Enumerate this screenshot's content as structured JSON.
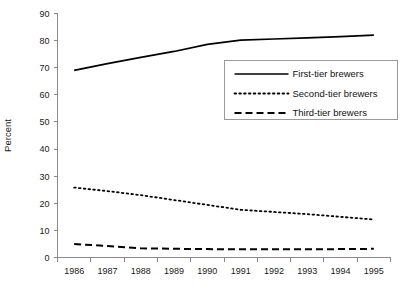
{
  "chart_data": {
    "type": "line",
    "title": "",
    "xlabel": "",
    "ylabel": "Percent",
    "x": [
      1986,
      1987,
      1988,
      1989,
      1990,
      1991,
      1992,
      1993,
      1994,
      1995
    ],
    "categories": [
      "1986",
      "1987",
      "1988",
      "1989",
      "1990",
      "1991",
      "1992",
      "1993",
      "1994",
      "1995"
    ],
    "xlim": [
      1986,
      1995
    ],
    "ylim": [
      0,
      90
    ],
    "ytick_values": [
      0,
      10,
      20,
      30,
      40,
      50,
      60,
      70,
      80,
      90
    ],
    "ytick_labels": [
      "0",
      "10",
      "20",
      "30",
      "40",
      "50",
      "60",
      "70",
      "80",
      "90"
    ],
    "grid": false,
    "legend_position": "upper-right-inside",
    "series": [
      {
        "name": "First-tier brewers",
        "style": "solid",
        "color": "#000000",
        "values": [
          69.0,
          71.5,
          73.8,
          76.0,
          78.6,
          80.2,
          80.6,
          81.0,
          81.5,
          82.0
        ]
      },
      {
        "name": "Second-tier brewers",
        "style": "dotted",
        "color": "#000000",
        "values": [
          25.8,
          24.5,
          23.0,
          21.2,
          19.4,
          17.6,
          16.8,
          16.0,
          15.0,
          14.0
        ]
      },
      {
        "name": "Third-tier brewers",
        "style": "dashed",
        "color": "#000000",
        "values": [
          5.0,
          4.2,
          3.4,
          3.2,
          3.1,
          3.0,
          3.0,
          3.0,
          3.1,
          3.2
        ]
      }
    ]
  },
  "axis": {
    "y_label": "Percent"
  },
  "legend": {
    "items": [
      {
        "label": "First-tier brewers",
        "style": "solid"
      },
      {
        "label": "Second-tier brewers",
        "style": "dotted"
      },
      {
        "label": "Third-tier brewers",
        "style": "dashed"
      }
    ]
  }
}
